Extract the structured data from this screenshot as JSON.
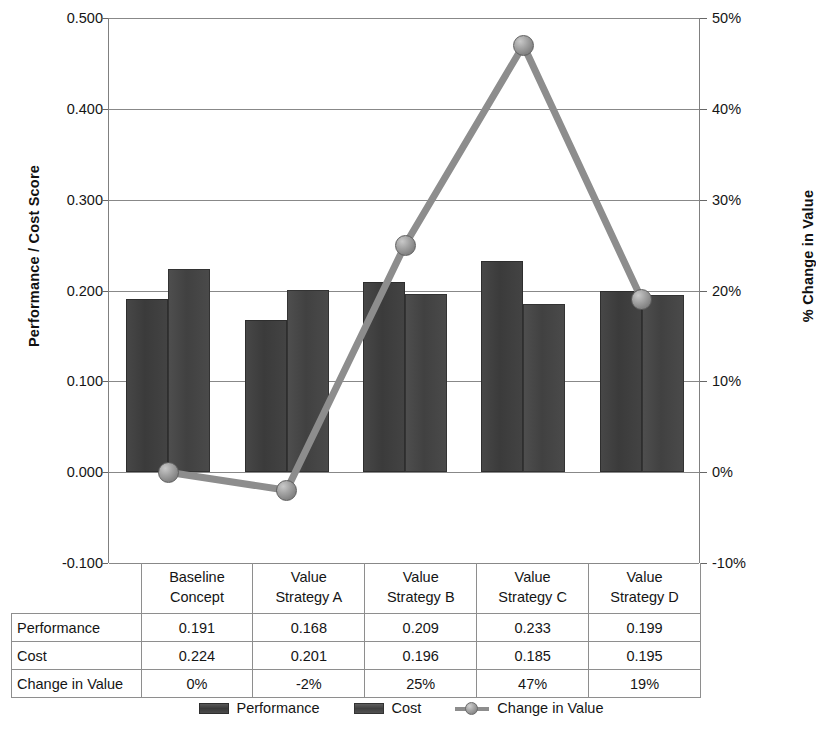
{
  "chart_data": {
    "type": "bar",
    "title": "",
    "categories": [
      "Baseline Concept",
      "Value Strategy A",
      "Value Strategy B",
      "Value Strategy C",
      "Value Strategy D"
    ],
    "category_lines": [
      [
        "Baseline",
        "Concept"
      ],
      [
        "Value",
        "Strategy A"
      ],
      [
        "Value",
        "Strategy B"
      ],
      [
        "Value",
        "Strategy C"
      ],
      [
        "Value",
        "Strategy D"
      ]
    ],
    "series": [
      {
        "name": "Performance",
        "type": "bar",
        "axis": "left",
        "values": [
          0.191,
          0.168,
          0.209,
          0.233,
          0.199
        ],
        "color": "#3f3f3f"
      },
      {
        "name": "Cost",
        "type": "bar",
        "axis": "left",
        "values": [
          0.224,
          0.201,
          0.196,
          0.185,
          0.195
        ],
        "color": "#474747"
      },
      {
        "name": "Change in Value",
        "type": "line",
        "axis": "right",
        "values": [
          0.0,
          -0.02,
          0.25,
          0.47,
          0.19
        ],
        "display_values": [
          "0%",
          "-2%",
          "25%",
          "47%",
          "19%"
        ],
        "color": "#8d8d8d"
      }
    ],
    "xlabel": "",
    "ylabel": "Performance / Cost Score",
    "y2label": "% Change in Value",
    "ylim": [
      -0.1,
      0.5
    ],
    "y2lim": [
      -0.1,
      0.5
    ],
    "yticks": [
      "0.500",
      "0.400",
      "0.300",
      "0.200",
      "0.100",
      "0.000",
      "-0.100"
    ],
    "ytick_values": [
      0.5,
      0.4,
      0.3,
      0.2,
      0.1,
      0.0,
      -0.1
    ],
    "y2ticks": [
      "50%",
      "40%",
      "30%",
      "20%",
      "10%",
      "0%",
      "-10%"
    ],
    "y2tick_values": [
      0.5,
      0.4,
      0.3,
      0.2,
      0.1,
      0.0,
      -0.1
    ],
    "grid": true,
    "legend_position": "bottom"
  },
  "axes": {
    "left_title": "Performance / Cost  Score",
    "right_title": "% Change in Value"
  },
  "table": {
    "header": [
      "",
      "Baseline Concept",
      "Value Strategy A",
      "Value Strategy B",
      "Value Strategy C",
      "Value Strategy D"
    ],
    "rows": [
      {
        "label": "Performance",
        "values": [
          "0.191",
          "0.168",
          "0.209",
          "0.233",
          "0.199"
        ]
      },
      {
        "label": "Cost",
        "values": [
          "0.224",
          "0.201",
          "0.196",
          "0.185",
          "0.195"
        ]
      },
      {
        "label": "Change in Value",
        "values": [
          "0%",
          "-2%",
          "25%",
          "47%",
          "19%"
        ]
      }
    ]
  },
  "legend": {
    "items": [
      {
        "label": "Performance",
        "kind": "bar"
      },
      {
        "label": "Cost",
        "kind": "bar"
      },
      {
        "label": "Change in Value",
        "kind": "line"
      }
    ]
  }
}
